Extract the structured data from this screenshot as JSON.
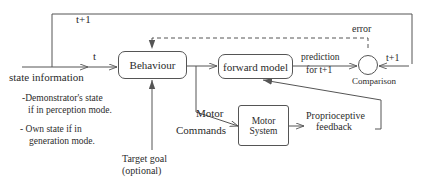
{
  "diagram": {
    "nodes": {
      "behaviour": {
        "label": "Behaviour"
      },
      "forward_model": {
        "label": "forward model"
      },
      "motor_system": {
        "label_line1": "Motor",
        "label_line2": "System"
      },
      "comparison": {
        "label": "Comparison"
      }
    },
    "labels": {
      "t_plus_1_top": "t+1",
      "t_edge": "t",
      "state_information": "state information",
      "demonstrator_line1": "-Demonstrator's state",
      "demonstrator_line2": "if  in perception mode.",
      "own_state_line1": "- Own state if  in",
      "own_state_line2": "generation mode.",
      "target_goal_line1": "Target goal",
      "target_goal_line2": "(optional)",
      "motor_commands_line1": "Motor",
      "motor_commands_line2": "Commands",
      "prediction_line1": "prediction",
      "prediction_line2": "for t+1",
      "error": "error",
      "t_plus_1_right": "t+1",
      "proprioceptive_line1": "Proprioceptive",
      "proprioceptive_line2": "feedback"
    },
    "style": {
      "stroke": "#555555",
      "text": "#2b2b2b",
      "background": "#ffffff"
    }
  }
}
